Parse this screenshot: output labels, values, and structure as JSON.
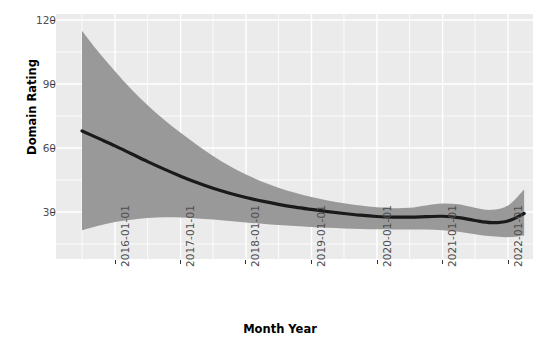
{
  "chart_data": {
    "type": "line",
    "title": "",
    "subtitle": "",
    "xlabel": "Month Year",
    "ylabel": "Domain Rating",
    "grid": true,
    "legend": false,
    "legend_position": "none",
    "x_type": "date",
    "xlim": [
      "2015-06-01",
      "2022-05-01"
    ],
    "ylim": [
      12,
      122
    ],
    "x_tick_labels": [
      "2016-01-01",
      "2017-01-01",
      "2018-01-01",
      "2019-01-01",
      "2020-01-01",
      "2021-01-01",
      "2022-01-01"
    ],
    "y_tick_labels": [
      "30",
      "60",
      "90",
      "120"
    ],
    "y_tick_values": [
      30,
      60,
      90,
      120
    ],
    "line_color": "#1a1a1a",
    "ribbon_color": "#999999",
    "panel_color": "#ebebeb",
    "gridline_color": "#ffffff",
    "series": [
      {
        "name": "loess fit",
        "x": [
          "2015-07-01",
          "2015-10-01",
          "2016-01-01",
          "2016-04-01",
          "2016-07-01",
          "2016-10-01",
          "2017-01-01",
          "2017-04-01",
          "2017-07-01",
          "2017-10-01",
          "2018-01-01",
          "2018-04-01",
          "2018-07-01",
          "2018-10-01",
          "2019-01-01",
          "2019-04-01",
          "2019-07-01",
          "2019-10-01",
          "2020-01-01",
          "2020-04-01",
          "2020-07-01",
          "2020-10-01",
          "2021-01-01",
          "2021-04-01",
          "2021-07-01",
          "2021-10-01",
          "2022-01-01",
          "2022-04-01"
        ],
        "values": [
          68.0,
          64.5,
          61.0,
          57.3,
          53.6,
          50.1,
          46.8,
          43.8,
          41.1,
          38.8,
          36.8,
          35.1,
          33.6,
          32.3,
          31.2,
          30.2,
          29.3,
          28.5,
          27.9,
          27.6,
          27.6,
          27.8,
          28.0,
          27.4,
          26.0,
          25.0,
          25.8,
          29.3
        ],
        "ci_lower": [
          21.5,
          23.6,
          25.3,
          26.4,
          27.2,
          27.5,
          27.4,
          27.0,
          26.5,
          25.8,
          25.1,
          24.5,
          23.9,
          23.4,
          23.0,
          22.6,
          22.3,
          22.0,
          21.9,
          21.8,
          21.8,
          21.8,
          21.5,
          20.8,
          19.6,
          18.6,
          18.2,
          19.0
        ],
        "ci_upper": [
          115.0,
          105.0,
          96.0,
          87.5,
          80.0,
          73.2,
          67.1,
          61.5,
          56.3,
          51.6,
          47.6,
          44.2,
          41.4,
          39.0,
          37.0,
          35.4,
          34.1,
          33.0,
          32.2,
          31.8,
          32.0,
          33.1,
          34.0,
          33.6,
          32.0,
          31.0,
          33.0,
          40.5
        ]
      }
    ]
  }
}
